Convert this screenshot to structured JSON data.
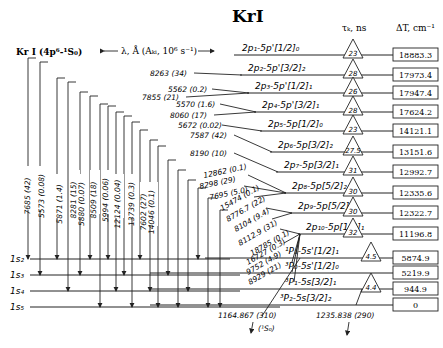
{
  "title": "KrI",
  "ground_label": "Kr I (4p⁶-¹S₀)",
  "wavelength_label": "λ, Å (Aₖᵢ, 10⁶ s⁻¹)",
  "tau_header": "τₖ, ns",
  "dt_header": "ΔT, cm⁻¹",
  "upper_levels": [
    {
      "label": "2p₁-5p'[1/2]₀",
      "tau": "23",
      "dt": "18883.3"
    },
    {
      "label": "2p₂-5p'[3/2]₂",
      "tau": "28",
      "dt": "17973.4"
    },
    {
      "label": "2p₃-5p'[1/2]₁",
      "tau": "26",
      "dt": "17947.4"
    },
    {
      "label": "2p₄-5p'[3/2]₁",
      "tau": "28",
      "dt": "17624.2"
    },
    {
      "label": "2p₅-5p[1/2]₀",
      "tau": "23",
      "dt": "14121.1"
    },
    {
      "label": "2p₆-5p[3/2]₂",
      "tau": "27.5",
      "dt": "13151.6"
    },
    {
      "label": "2p₇-5p[3/2]₁",
      "tau": "31",
      "dt": "12992.7"
    },
    {
      "label": "2p₈-5p[5/2]₂",
      "tau": "30",
      "dt": "12335.6"
    },
    {
      "label": "2p₉-5p[5/2]₃",
      "tau": "30",
      "dt": "12322.7"
    },
    {
      "label": "2p₁₀-5p[1/2]₁",
      "tau": "32",
      "dt": "11196.8"
    }
  ],
  "lower_levels": [
    {
      "label": "¹P₁-5s'[1/2]₁",
      "tau": "4.5",
      "dt": "5874.9"
    },
    {
      "label": "³P₀-5s'[1/2]₀",
      "tau": "",
      "dt": "5219.9"
    },
    {
      "label": "³P₁-5s[3/2]₁",
      "tau": "4.4",
      "dt": "944.9"
    },
    {
      "label": "³P₂-5s[3/2]₂",
      "tau": "",
      "dt": "0"
    }
  ],
  "s_levels": [
    "1s₂",
    "1s₃",
    "1s₄",
    "1s₅"
  ],
  "transitions_horizontal": [
    "8263 (34)",
    "5562 (0.2)",
    "7855 (21)",
    "5570 (1.6)",
    "8060 (17)",
    "5672 (0.02)",
    "7587 (42)",
    "8190 (10)",
    "12862 (0.1)",
    "8298 (29)",
    "7695 (5.0)",
    "15474 (0.1)",
    "8776.7 (22)",
    "8104 (9.4)",
    "8112.9 (31)",
    "18785 (0.1)",
    "16727 (0.3)",
    "9752 (4.9)",
    "8929 (21)"
  ],
  "transitions_vertical": [
    "7685 (42)",
    "5573 (0.08)",
    "5871 (1.4)",
    "8281 (15)",
    "5880 (0.07)",
    "8509 (18)",
    "5994 (0.06)",
    "12124 (0.04)",
    "13739 (0.3)",
    "7602 (27)",
    "14046 (0.1)"
  ],
  "resonance": [
    {
      "label": "1164.867 (310)",
      "sub": "(¹S₀)"
    },
    {
      "label": "1235.838 (290)"
    }
  ]
}
